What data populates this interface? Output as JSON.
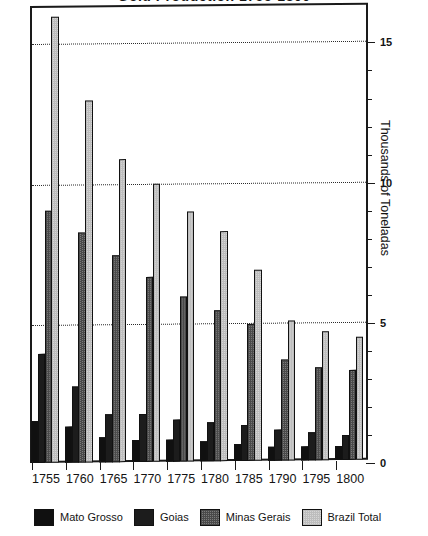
{
  "chart_data": {
    "type": "bar",
    "title": "Gold Production 1755-1800",
    "xlabel": "",
    "ylabel": "Thousands of Toneladas",
    "categories": [
      "1755",
      "1760",
      "1765",
      "1770",
      "1775",
      "1780",
      "1785",
      "1790",
      "1795",
      "1800"
    ],
    "series": [
      {
        "name": "Mato Grosso",
        "color": "#101010",
        "values": [
          1.5,
          1.3,
          0.9,
          0.8,
          0.8,
          0.7,
          0.6,
          0.5,
          0.5,
          0.5
        ]
      },
      {
        "name": "Goias",
        "color": "#1c1c1c",
        "values": [
          3.9,
          2.7,
          1.7,
          1.7,
          1.5,
          1.4,
          1.3,
          1.1,
          1.0,
          0.9
        ]
      },
      {
        "name": "Minas Gerais",
        "color": "#7c7c7c",
        "values": [
          9.0,
          8.2,
          7.4,
          6.6,
          5.9,
          5.4,
          4.9,
          3.6,
          3.3,
          3.2
        ]
      },
      {
        "name": "Brazil Total",
        "color": "#d6d6d6",
        "values": [
          15.9,
          12.9,
          10.8,
          9.9,
          8.9,
          8.2,
          6.8,
          5.0,
          4.6,
          4.4
        ]
      }
    ],
    "ylim": [
      0,
      16.3
    ],
    "yticks_major": [
      0,
      5,
      10,
      15
    ],
    "yticks_minor": [
      1,
      2,
      3,
      4,
      6,
      7,
      8,
      9,
      11,
      12,
      13,
      14
    ],
    "gridlines": [
      5,
      10,
      15
    ],
    "grid": true,
    "axis_position": "right",
    "legend_position": "bottom"
  },
  "legend": {
    "items": [
      {
        "label": "Mato Grosso",
        "swatch": "mato"
      },
      {
        "label": "Goias",
        "swatch": "goias"
      },
      {
        "label": "Minas Gerais",
        "swatch": "minas"
      },
      {
        "label": "Brazil Total",
        "swatch": "brazil"
      }
    ]
  }
}
